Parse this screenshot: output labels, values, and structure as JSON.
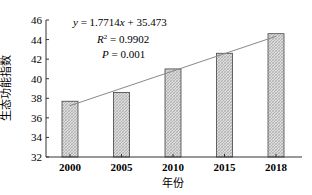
{
  "chart_data": {
    "type": "bar",
    "title": "",
    "xlabel": "年份",
    "ylabel": "生态功能指数",
    "categories": [
      "2000",
      "2005",
      "2010",
      "2015",
      "2018"
    ],
    "values": [
      37.7,
      38.6,
      41.0,
      42.6,
      44.6
    ],
    "ylim": [
      32,
      46
    ],
    "yticks": [
      32,
      34,
      36,
      38,
      40,
      42,
      44,
      46
    ],
    "grid": false,
    "legend": null,
    "trendline": {
      "type": "linear",
      "equation": "y = 1.7714x + 35.473",
      "slope": 1.7714,
      "intercept": 35.473,
      "r_squared": "R² = 0.9902",
      "p_value": "P = 0.001"
    },
    "bar_fill": "#d0d0d0",
    "bar_pattern": "crosshatch",
    "bar_stroke": "#444444",
    "line_color": "#888888"
  },
  "annotations": {
    "equation_y": "y",
    "equation_rest": " = 1.7714",
    "equation_x": "x",
    "equation_tail": " + 35.473",
    "r2_label": "R",
    "r2_sup": "2",
    "r2_value": " = 0.9902",
    "p_label": "P",
    "p_value": " = 0.001"
  }
}
